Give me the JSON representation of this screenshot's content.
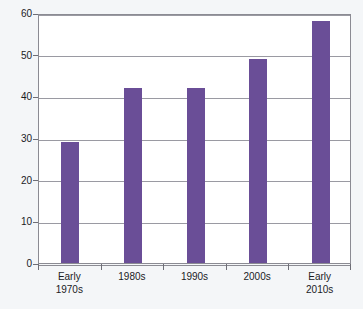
{
  "chart_data": {
    "type": "bar",
    "title": "",
    "subtitle": "",
    "xlabel": "",
    "ylabel": "",
    "categories": [
      "Early\n1970s",
      "1980s",
      "1990s",
      "2000s",
      "Early\n2010s"
    ],
    "values": [
      29,
      42,
      42,
      49,
      58
    ],
    "series": [
      {
        "name": "",
        "values": [
          29,
          42,
          42,
          49,
          58
        ]
      }
    ],
    "ylim": [
      0,
      60
    ],
    "xlim": [
      0,
      5
    ],
    "y_ticks": [
      0,
      10,
      20,
      30,
      40,
      50,
      60
    ],
    "y_tick_labels": [
      "0",
      "10",
      "20",
      "30",
      "40",
      "50",
      "60"
    ],
    "grid": true,
    "grid_axis": "y",
    "legend": false,
    "legend_position": "none",
    "annotations": [],
    "colors": {
      "bar_fill": "#6a4e97",
      "bar_edge": "#6a4e97",
      "gridline": "#9a9aa2",
      "axis_line": "#8b8b93",
      "plot_background": "#ffffff",
      "figure_background": "#f4f6f8",
      "tick_label": "#1b1b1f"
    }
  }
}
